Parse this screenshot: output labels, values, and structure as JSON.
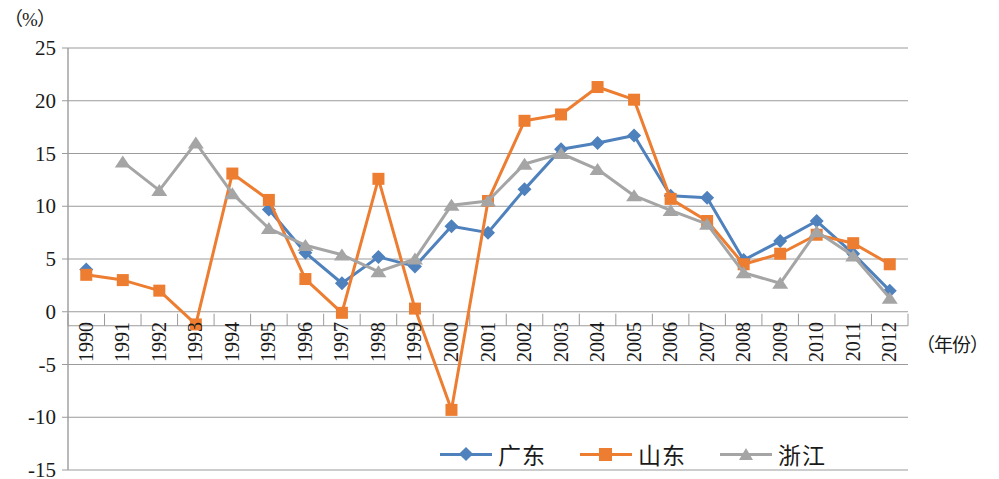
{
  "chart_data": {
    "type": "line",
    "title": "",
    "xlabel": "（年份）",
    "ylabel": "（%）",
    "ylim": [
      -15,
      25
    ],
    "ytick_labels": [
      "25",
      "20",
      "15",
      "10",
      "5",
      "0",
      "-5",
      "-10",
      "-15"
    ],
    "ytick_values": [
      25,
      20,
      15,
      10,
      5,
      0,
      -5,
      -10,
      -15
    ],
    "grid": true,
    "legend_position": "bottom",
    "categories": [
      "1990",
      "1991",
      "1992",
      "1993",
      "1994",
      "1995",
      "1996",
      "1997",
      "1998",
      "1999",
      "2000",
      "2001",
      "2002",
      "2003",
      "2004",
      "2005",
      "2006",
      "2007",
      "2008",
      "2009",
      "2010",
      "2011",
      "2012"
    ],
    "x": [
      1990,
      1991,
      1992,
      1993,
      1994,
      1995,
      1996,
      1997,
      1998,
      1999,
      2000,
      2001,
      2002,
      2003,
      2004,
      2005,
      2006,
      2007,
      2008,
      2009,
      2010,
      2011,
      2012
    ],
    "series": [
      {
        "name": "广东",
        "color": "#4F81BD",
        "marker": "diamond",
        "values": [
          4.0,
          null,
          null,
          null,
          null,
          9.7,
          5.6,
          2.7,
          5.2,
          4.3,
          8.1,
          7.5,
          11.6,
          15.4,
          16.0,
          16.7,
          11.0,
          10.8,
          4.9,
          6.7,
          8.6,
          5.5,
          2.0
        ]
      },
      {
        "name": "山东",
        "color": "#ED7D31",
        "marker": "square",
        "values": [
          3.5,
          3.0,
          2.0,
          -1.2,
          13.1,
          10.6,
          3.1,
          -0.1,
          12.6,
          0.3,
          -9.3,
          10.5,
          18.1,
          18.7,
          21.3,
          20.1,
          10.7,
          8.6,
          4.5,
          5.5,
          7.3,
          6.5,
          4.5
        ]
      },
      {
        "name": "浙江",
        "color": "#A5A5A5",
        "marker": "triangle",
        "values": [
          null,
          14.2,
          11.5,
          16.0,
          11.2,
          7.9,
          6.3,
          5.4,
          3.8,
          5.0,
          10.1,
          10.5,
          14.0,
          15.0,
          13.5,
          11.0,
          9.6,
          8.3,
          3.7,
          2.7,
          7.6,
          5.3,
          1.3
        ]
      }
    ]
  },
  "legend": {
    "items": [
      {
        "label": "广东",
        "color": "#4F81BD",
        "marker": "diamond"
      },
      {
        "label": "山东",
        "color": "#ED7D31",
        "marker": "square"
      },
      {
        "label": "浙江",
        "color": "#A5A5A5",
        "marker": "triangle"
      }
    ]
  },
  "axes": {
    "y_unit": "（%）",
    "x_title": "（年份）"
  }
}
